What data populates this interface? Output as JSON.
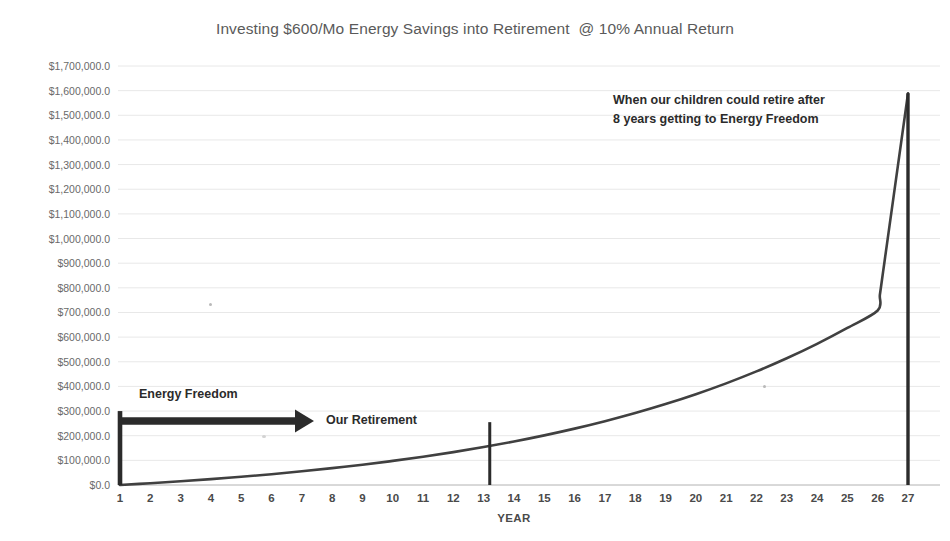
{
  "chart_data": {
    "type": "line",
    "title": "Investing $600/Mo Energy Savings into Retirement  @ 10% Annual Return",
    "xlabel": "YEAR",
    "ylabel": "",
    "grid": true,
    "legend": "none",
    "xlim": [
      1,
      27
    ],
    "ylim": [
      0,
      1700000
    ],
    "x": [
      1,
      2,
      3,
      4,
      5,
      6,
      7,
      8,
      9,
      10,
      11,
      12,
      13,
      14,
      15,
      16,
      17,
      18,
      19,
      20,
      21,
      22,
      23,
      24,
      25,
      26,
      27
    ],
    "categories": [
      "1",
      "2",
      "3",
      "4",
      "5",
      "6",
      "7",
      "8",
      "9",
      "10",
      "11",
      "12",
      "13",
      "14",
      "15",
      "16",
      "17",
      "18",
      "19",
      "20",
      "21",
      "22",
      "23",
      "24",
      "25",
      "26",
      "27"
    ],
    "series": [
      {
        "name": "Retirement balance",
        "values": [
          0,
          7200,
          15120,
          23832,
          33415,
          43957,
          55552,
          68308,
          82338,
          97772,
          114749,
          133424,
          153967,
          176563,
          201420,
          228762,
          258838,
          291922,
          328314,
          368345,
          412380,
          460818,
          514100,
          572710,
          637181,
          708099,
          1589000
        ]
      }
    ],
    "y_tick_labels": [
      "$1,700,000.0",
      "$1,600,000.0",
      "$1,500,000.0",
      "$1,400,000.0",
      "$1,300,000.0",
      "$1,200,000.0",
      "$1,100,000.0",
      "$1,000,000.0",
      "$900,000.0",
      "$800,000.0",
      "$700,000.0",
      "$600,000.0",
      "$500,000.0",
      "$400,000.0",
      "$300,000.0",
      "$200,000.0",
      "$100,000.0",
      "$0.0"
    ],
    "y_tick_values": [
      1700000,
      1600000,
      1500000,
      1400000,
      1300000,
      1200000,
      1100000,
      1000000,
      900000,
      800000,
      700000,
      600000,
      500000,
      400000,
      300000,
      200000,
      100000,
      0
    ],
    "annotations": [
      {
        "name": "energy-freedom",
        "text": "Energy Freedom",
        "kind": "arrow-label",
        "x_start_year": 1,
        "x_end_year": 7.4,
        "y_value": 260000
      },
      {
        "name": "our-retirement",
        "text": "Our Retirement",
        "kind": "marker-label",
        "x_year": 13.2,
        "y_value": 215000
      },
      {
        "name": "children-retire",
        "text": "When our children could retire after\n8 years getting to Energy Freedom",
        "kind": "callout",
        "x_year": 27,
        "y_value": 1589000
      }
    ],
    "markers": [
      {
        "name": "year-1-marker",
        "x_year": 1,
        "y_top": 300000,
        "y_bottom": 0
      },
      {
        "name": "our-retirement-marker",
        "x_year": 13.2,
        "y_top": 255000,
        "y_bottom": 0
      },
      {
        "name": "year-27-marker",
        "x_year": 27,
        "y_top": 1589000,
        "y_bottom": 0
      }
    ],
    "colors": {
      "series_line": "#404040",
      "grid": "#e8e8e8",
      "axis": "#c8c8c8",
      "title_text": "#5a5a5a",
      "tick_text": "#6a6a6a",
      "annotation_text": "#2b2b2b",
      "marker": "#2b2b2b",
      "background": "#ffffff"
    }
  }
}
